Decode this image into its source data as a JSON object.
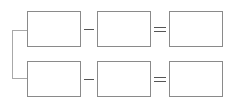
{
  "header": {
    "partial_text": ""
  },
  "diagram": {
    "type": "subtraction-equation-boxes",
    "rows": [
      {
        "operand1": "",
        "operator": "−",
        "operand2": "",
        "equals": "=",
        "result": ""
      },
      {
        "operand1": "",
        "operator": "−",
        "operand2": "",
        "equals": "=",
        "result": ""
      }
    ],
    "colors": {
      "box_border": "#8a8a8a",
      "bracket": "#a8a8a8",
      "symbols": "#555555"
    }
  }
}
